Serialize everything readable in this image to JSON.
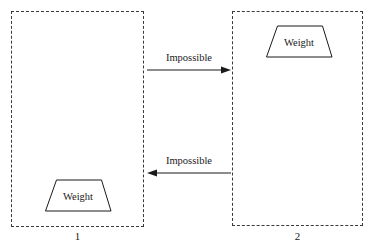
{
  "diagram": {
    "background_color": "#ffffff",
    "line_color": "#1a1a1a",
    "dash_color": "#3a3a3a",
    "regions": [
      {
        "id": "region-1",
        "label": "1",
        "border_style": "dashed",
        "weight": {
          "label": "Weight",
          "shape": "trapezoid",
          "position": "bottom-left"
        }
      },
      {
        "id": "region-2",
        "label": "2",
        "border_style": "dashed",
        "weight": {
          "label": "Weight",
          "shape": "trapezoid",
          "position": "top-center"
        }
      }
    ],
    "arrows": [
      {
        "id": "arrow-forward",
        "label": "Impossible",
        "direction": "right",
        "from": "1",
        "to": "2"
      },
      {
        "id": "arrow-backward",
        "label": "Impossible",
        "direction": "left",
        "from": "2",
        "to": "1"
      }
    ]
  }
}
